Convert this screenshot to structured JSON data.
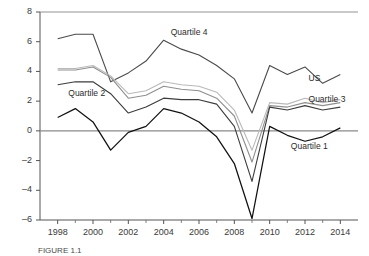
{
  "chart_data": {
    "type": "line",
    "title": "",
    "subtitle": "",
    "xlabel": "",
    "ylabel": "",
    "xlim": [
      1997,
      2015
    ],
    "ylim": [
      -6,
      8
    ],
    "grid": false,
    "legend_position": "inline-labels",
    "x": [
      1998,
      1999,
      2000,
      2001,
      2002,
      2003,
      2004,
      2005,
      2006,
      2007,
      2008,
      2009,
      2010,
      2011,
      2012,
      2013,
      2014
    ],
    "xticks": [
      1998,
      2000,
      2002,
      2004,
      2006,
      2008,
      2010,
      2012,
      2014
    ],
    "yticks": [
      -6,
      -4,
      -2,
      0,
      2,
      4,
      6,
      8
    ],
    "series": [
      {
        "name": "Quartile 4",
        "color": "#4a4a4a",
        "label_x": 2004.4,
        "label_y": 6.6,
        "values": [
          6.2,
          6.5,
          6.5,
          3.3,
          3.9,
          4.7,
          6.1,
          5.5,
          5.1,
          4.4,
          3.5,
          1.2,
          4.4,
          3.8,
          4.3,
          3.2,
          3.8
        ]
      },
      {
        "name": "US",
        "color": "#b9b9b9",
        "label_x": 2012.2,
        "label_y": 3.5,
        "values": [
          4.2,
          4.2,
          4.4,
          3.7,
          2.5,
          2.7,
          3.3,
          3.1,
          3.0,
          2.6,
          1.4,
          -1.3,
          1.9,
          1.8,
          2.2,
          1.9,
          2.1
        ]
      },
      {
        "name": "Quartile 3",
        "color": "#8f8f8f",
        "label_x": 2012.2,
        "label_y": 2.1,
        "values": [
          4.1,
          4.1,
          4.3,
          3.6,
          2.2,
          2.4,
          3.0,
          2.8,
          2.7,
          2.2,
          1.0,
          -2.1,
          1.7,
          1.6,
          1.9,
          1.7,
          1.9
        ]
      },
      {
        "name": "Quartile 2",
        "color": "#3c3c3c",
        "label_x": 1998.6,
        "label_y": 2.5,
        "values": [
          3.1,
          3.3,
          3.3,
          2.5,
          1.2,
          1.6,
          2.2,
          2.1,
          2.1,
          1.8,
          0.3,
          -3.4,
          1.6,
          1.4,
          1.7,
          1.4,
          1.6
        ]
      },
      {
        "name": "Quartile 1",
        "color": "#111111",
        "label_x": 2011.2,
        "label_y": -1.1,
        "values": [
          0.9,
          1.5,
          0.6,
          -1.3,
          -0.1,
          0.3,
          1.5,
          1.2,
          0.6,
          -0.4,
          -2.2,
          -5.9,
          0.3,
          -0.3,
          -0.7,
          -0.4,
          0.2
        ]
      }
    ]
  },
  "caption": "FIGURE 1.1"
}
